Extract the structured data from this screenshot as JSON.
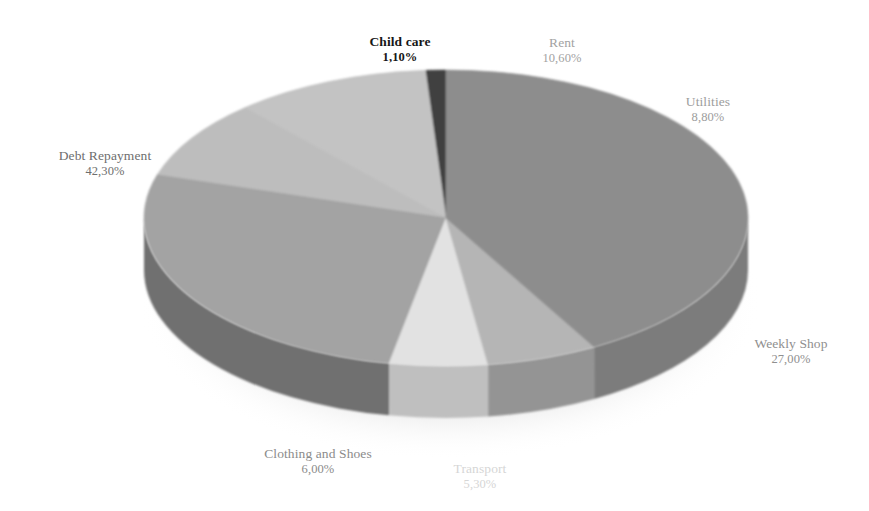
{
  "chart_data": {
    "type": "pie",
    "title": "",
    "subtitle": "",
    "xlabel": "",
    "ylabel": "",
    "legend_position": "none",
    "grid": false,
    "three_d": true,
    "value_suffix": "%",
    "decimal_separator": ",",
    "categories": [
      "Child care",
      "Rent",
      "Utilities",
      "Weekly Shop",
      "Transport",
      "Clothing and Shoes",
      "Debt Repayment"
    ],
    "values": [
      1.1,
      10.6,
      8.8,
      27.0,
      5.3,
      6.0,
      42.3
    ],
    "value_labels": [
      "1,10%",
      "10,60%",
      "8,80%",
      "27,00%",
      "5,30%",
      "6,00%",
      "42,30%"
    ],
    "colors": [
      "#3f3f3f",
      "#c3c3c3",
      "#bdbdbd",
      "#a3a3a3",
      "#e2e2e2",
      "#b5b5b5",
      "#8d8d8d"
    ],
    "side_colors": [
      "#2b2b2b",
      "#9e9e9e",
      "#999999",
      "#6f6f6f",
      "#bfbfbf",
      "#949494",
      "#7b7b7b"
    ],
    "slices": [
      {
        "label": "Child care",
        "value": 1.1,
        "value_label": "1,10%",
        "color": "#3f3f3f",
        "side_color": "#2b2b2b"
      },
      {
        "label": "Rent",
        "value": 10.6,
        "value_label": "10,60%",
        "color": "#c3c3c3",
        "side_color": "#9e9e9e"
      },
      {
        "label": "Utilities",
        "value": 8.8,
        "value_label": "8,80%",
        "color": "#bdbdbd",
        "side_color": "#999999"
      },
      {
        "label": "Weekly Shop",
        "value": 27.0,
        "value_label": "27,00%",
        "color": "#a3a3a3",
        "side_color": "#6f6f6f"
      },
      {
        "label": "Transport",
        "value": 5.3,
        "value_label": "5,30%",
        "color": "#e2e2e2",
        "side_color": "#bfbfbf"
      },
      {
        "label": "Clothing and Shoes",
        "value": 6.0,
        "value_label": "6,00%",
        "color": "#b5b5b5",
        "side_color": "#949494"
      },
      {
        "label": "Debt Repayment",
        "value": 42.3,
        "value_label": "42,30%",
        "color": "#8d8d8d",
        "side_color": "#7b7b7b"
      }
    ]
  },
  "labels": {
    "child_care": {
      "name": "Child care",
      "value": "1,10%"
    },
    "rent": {
      "name": "Rent",
      "value": "10,60%"
    },
    "utilities": {
      "name": "Utilities",
      "value": "8,80%"
    },
    "weekly_shop": {
      "name": "Weekly Shop",
      "value": "27,00%"
    },
    "transport": {
      "name": "Transport",
      "value": "5,30%"
    },
    "clothing": {
      "name": "Clothing and Shoes",
      "value": "6,00%"
    },
    "debt": {
      "name": "Debt Repayment",
      "value": "42,30%"
    }
  },
  "geometry": {
    "center_x": 446,
    "center_y": 218,
    "radius_x": 302,
    "radius_y": 148,
    "depth": 52,
    "start_angle_deg": -90
  }
}
